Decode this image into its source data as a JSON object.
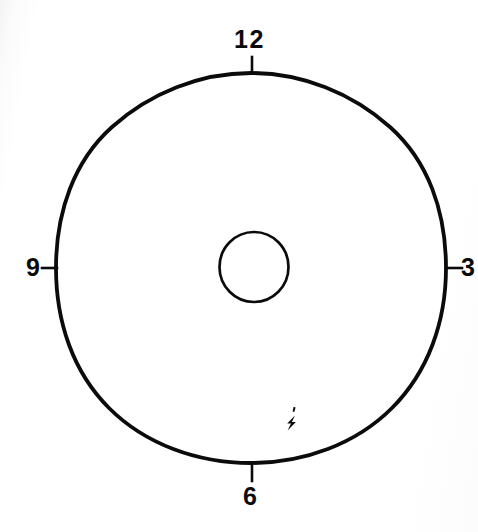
{
  "figure": {
    "background_color": "#ffffff",
    "ink_color": "#0b0b0b",
    "width": 478,
    "height": 532
  },
  "dial": {
    "outer_circle": {
      "name": "outer-bezel",
      "center_x": 251,
      "center_y": 268,
      "radius": 195,
      "stroke_width": 3.6,
      "stroke_color": "#0b0b0b",
      "fill": "none"
    },
    "inner_circle": {
      "name": "center-hub",
      "center_x": 254,
      "center_y": 267,
      "radius": 34,
      "stroke_width": 2.6,
      "stroke_color": "#0b0b0b",
      "fill": "none"
    }
  },
  "hour_markers": [
    {
      "hour": "12",
      "position": "top",
      "label": "12",
      "tick_length": 14
    },
    {
      "hour": "3",
      "position": "right",
      "label": "3",
      "tick_length": 14
    },
    {
      "hour": "6",
      "position": "bottom",
      "label": "6",
      "tick_length": 14
    },
    {
      "hour": "9",
      "position": "left",
      "label": "9",
      "tick_length": 14
    }
  ],
  "marks": {
    "battery_flash": {
      "icon": "lightning-bolt-icon",
      "label": "",
      "x": 291,
      "y": 420
    }
  }
}
